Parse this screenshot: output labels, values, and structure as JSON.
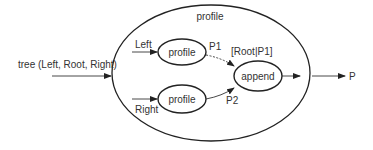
{
  "diagram": {
    "outer": {
      "label": "profile"
    },
    "input": {
      "label": "tree (Left, Root, Right)"
    },
    "output": {
      "label": "P"
    },
    "nodes": {
      "profile_left": {
        "label": "profile"
      },
      "profile_right": {
        "label": "profile"
      },
      "append": {
        "label": "append"
      }
    },
    "edge_labels": {
      "left": "Left",
      "right": "Right",
      "p1": "P1",
      "p2": "P2",
      "root_p1": "[Root|P1]"
    },
    "colors": {
      "stroke": "#222222",
      "text": "#333333",
      "background": "#ffffff"
    }
  }
}
